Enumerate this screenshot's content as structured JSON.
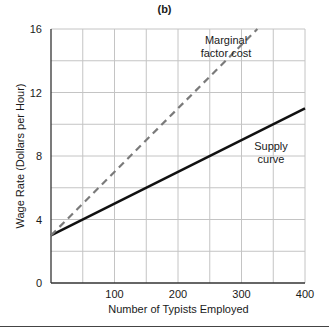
{
  "chart_data": {
    "type": "line",
    "panel_label": "(b)",
    "title": "",
    "xlabel": "Number of Typists Employed",
    "ylabel": "Wage Rate (Dollars per Hour)",
    "xlim": [
      0,
      400
    ],
    "ylim": [
      0,
      16
    ],
    "x_ticks": [
      100,
      200,
      300,
      400
    ],
    "y_ticks": [
      0,
      4,
      8,
      12,
      16
    ],
    "grid": {
      "x_step": 50,
      "y_step": 2,
      "on": true
    },
    "series": [
      {
        "name": "Supply curve",
        "style": "solid",
        "color": "#111111",
        "x": [
          0,
          400
        ],
        "y": [
          3,
          11
        ]
      },
      {
        "name": "Marginal factor cost",
        "style": "dashed",
        "color": "#7a7a7a",
        "x": [
          0,
          325
        ],
        "y": [
          3,
          16
        ]
      }
    ],
    "annotations": [
      {
        "text_lines": [
          "Marginal",
          "factor cost"
        ],
        "near_series": "Marginal factor cost"
      },
      {
        "text_lines": [
          "Supply",
          "curve"
        ],
        "near_series": "Supply curve"
      }
    ]
  },
  "labels": {
    "panel": "(b)",
    "xlabel": "Number of Typists Employed",
    "ylabel": "Wage Rate (Dollars per Hour)",
    "y_ticks": [
      "16",
      "12",
      "8",
      "4",
      "0"
    ],
    "x_ticks": [
      "100",
      "200",
      "300",
      "400"
    ],
    "mfc_line1": "Marginal",
    "mfc_line2": "factor cost",
    "supply_line1": "Supply",
    "supply_line2": "curve"
  }
}
